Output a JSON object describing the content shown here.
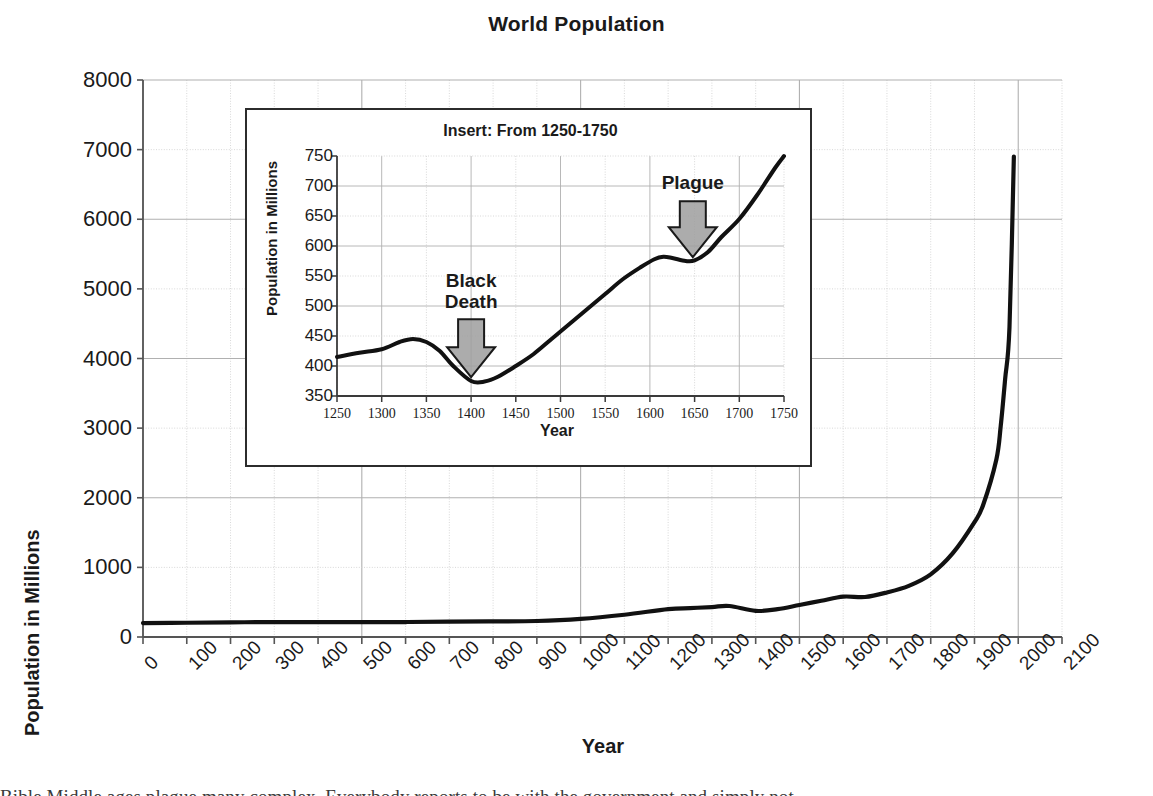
{
  "chart_data": {
    "type": "line",
    "title": "World Population",
    "xlabel": "Year",
    "ylabel": "Population in Millions",
    "xlim": [
      0,
      2100
    ],
    "ylim": [
      0,
      8000
    ],
    "xtick_step": 100,
    "ytick_step": 1000,
    "grid": true,
    "legend": "none",
    "x_tick_labels": [
      "0",
      "100",
      "200",
      "300",
      "400",
      "500",
      "600",
      "700",
      "800",
      "900",
      "1000",
      "1100",
      "1200",
      "1300",
      "1400",
      "1500",
      "1600",
      "1700",
      "1800",
      "1900",
      "2000",
      "2100"
    ],
    "y_tick_labels": [
      "0",
      "1000",
      "2000",
      "3000",
      "4000",
      "5000",
      "6000",
      "7000",
      "8000"
    ],
    "series": [
      {
        "name": "World population",
        "x": [
          0,
          100,
          200,
          300,
          400,
          500,
          600,
          700,
          800,
          900,
          1000,
          1100,
          1200,
          1250,
          1300,
          1340,
          1400,
          1450,
          1500,
          1550,
          1600,
          1650,
          1700,
          1750,
          1800,
          1850,
          1900,
          1920,
          1950,
          1960,
          1970,
          1980,
          1990
        ],
        "values": [
          200,
          205,
          210,
          215,
          215,
          215,
          215,
          220,
          225,
          230,
          260,
          320,
          400,
          415,
          430,
          445,
          375,
          400,
          460,
          520,
          580,
          575,
          640,
          735,
          900,
          1200,
          1650,
          1900,
          2550,
          3030,
          3700,
          4450,
          6900
        ]
      }
    ],
    "inset": {
      "type": "line",
      "title": "Insert: From 1250-1750",
      "xlabel": "Year",
      "ylabel": "Population in Millions",
      "xlim": [
        1250,
        1750
      ],
      "ylim": [
        350,
        750
      ],
      "xtick_step": 50,
      "ytick_step": 50,
      "grid": true,
      "x_tick_labels": [
        "1250",
        "1300",
        "1350",
        "1400",
        "1450",
        "1500",
        "1550",
        "1600",
        "1650",
        "1700",
        "1750"
      ],
      "y_tick_labels": [
        "350",
        "400",
        "450",
        "500",
        "550",
        "600",
        "650",
        "700",
        "750"
      ],
      "series": [
        {
          "name": "World population (1250-1750)",
          "x": [
            1250,
            1275,
            1300,
            1320,
            1335,
            1350,
            1365,
            1380,
            1400,
            1415,
            1430,
            1450,
            1470,
            1490,
            1510,
            1530,
            1550,
            1570,
            1590,
            1605,
            1615,
            1625,
            1640,
            1650,
            1665,
            1680,
            1700,
            1720,
            1740,
            1750
          ],
          "values": [
            415,
            422,
            428,
            440,
            445,
            440,
            425,
            400,
            375,
            374,
            382,
            400,
            420,
            445,
            470,
            495,
            520,
            545,
            565,
            578,
            582,
            580,
            575,
            576,
            590,
            615,
            645,
            685,
            730,
            750
          ]
        }
      ],
      "annotations": [
        {
          "label": "Black\nDeath",
          "label_line1": "Black",
          "label_line2": "Death",
          "arrow": "down-arrow",
          "x": 1400,
          "points_to_y": 378,
          "arrow_fill": "#9e9e9e",
          "arrow_stroke": "#1a1a1a"
        },
        {
          "label": "Plague",
          "label_line1": "Plague",
          "label_line2": "",
          "arrow": "down-arrow",
          "x": 1648,
          "points_to_y": 578,
          "arrow_fill": "#9e9e9e",
          "arrow_stroke": "#1a1a1a"
        }
      ]
    },
    "colors": {
      "line": "#111111",
      "grid_major": "#b0b0b0",
      "grid_minor": "#d4d4d4",
      "axis": "#555555",
      "text": "#1a1a1a",
      "inset_border": "#2c2c2c",
      "arrow_fill": "#9e9e9e"
    }
  },
  "caption": {
    "sliver_text": "Bible Middle ages plague many complex. Everybody reports to be with the government and simply not"
  }
}
